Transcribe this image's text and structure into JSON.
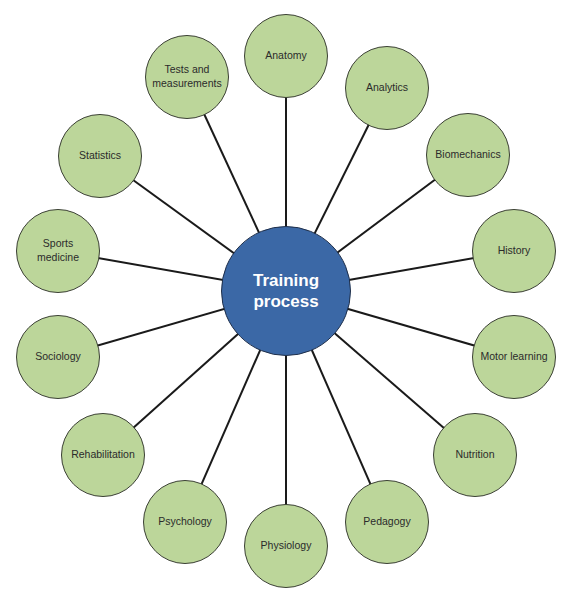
{
  "diagram": {
    "colors": {
      "hub": "#3b68a6",
      "node": "#bcd69a",
      "stroke": "#1a1a1a",
      "hub_text": "#ffffff",
      "node_text": "#2b2b2b"
    },
    "hub": {
      "label": "Training\nprocess",
      "cx": 286,
      "cy": 291,
      "r": 65
    },
    "node_radius": 42,
    "nodes": [
      {
        "label": "Anatomy",
        "cx": 286,
        "cy": 56
      },
      {
        "label": "Analytics",
        "cx": 387,
        "cy": 88
      },
      {
        "label": "Biomechanics",
        "cx": 468,
        "cy": 155
      },
      {
        "label": "History",
        "cx": 514,
        "cy": 251
      },
      {
        "label": "Motor learning",
        "cx": 514,
        "cy": 357
      },
      {
        "label": "Nutrition",
        "cx": 475,
        "cy": 455
      },
      {
        "label": "Pedagogy",
        "cx": 387,
        "cy": 522
      },
      {
        "label": "Physiology",
        "cx": 286,
        "cy": 546
      },
      {
        "label": "Psychology",
        "cx": 185,
        "cy": 522
      },
      {
        "label": "Rehabilitation",
        "cx": 103,
        "cy": 455
      },
      {
        "label": "Sociology",
        "cx": 58,
        "cy": 357
      },
      {
        "label": "Sports\nmedicine",
        "cx": 58,
        "cy": 251
      },
      {
        "label": "Statistics",
        "cx": 100,
        "cy": 156
      },
      {
        "label": "Tests and\nmeasurements",
        "cx": 187,
        "cy": 77
      }
    ]
  }
}
